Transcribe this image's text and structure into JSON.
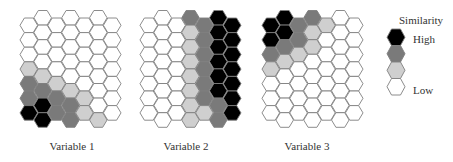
{
  "chart_data": {
    "type": "heatmap",
    "subtype": "hexagonal self-organizing map component planes",
    "title": "",
    "scale": {
      "legend_title": "Similarity",
      "high_label": "High",
      "low_label": "Low",
      "levels": [
        {
          "level": 3,
          "name": "high",
          "color": "#000000"
        },
        {
          "level": 2,
          "name": "mid-high",
          "color": "#7a7a7a"
        },
        {
          "level": 1,
          "name": "mid-low",
          "color": "#cfcfcf"
        },
        {
          "level": 0,
          "name": "low",
          "color": "#ffffff"
        }
      ]
    },
    "grid": {
      "columns": 7,
      "rows_even_column": 7,
      "rows_odd_column": 8,
      "orientation": "flat-top hexagons, odd columns shifted up by half a cell"
    },
    "maps": [
      {
        "label": "Variable 1",
        "columns": [
          [
            0,
            0,
            0,
            1,
            2,
            2,
            3
          ],
          [
            0,
            0,
            0,
            0,
            1,
            2,
            3,
            3
          ],
          [
            0,
            0,
            0,
            0,
            1,
            2,
            2
          ],
          [
            0,
            0,
            0,
            0,
            0,
            1,
            2,
            2
          ],
          [
            0,
            0,
            0,
            0,
            0,
            1,
            1
          ],
          [
            0,
            0,
            0,
            0,
            0,
            0,
            0,
            1
          ],
          [
            0,
            0,
            0,
            0,
            0,
            0,
            0
          ]
        ]
      },
      {
        "label": "Variable 2",
        "columns": [
          [
            0,
            0,
            0,
            0,
            0,
            0,
            0
          ],
          [
            0,
            0,
            0,
            0,
            0,
            0,
            0,
            0
          ],
          [
            0,
            0,
            0,
            0,
            0,
            0,
            0
          ],
          [
            2,
            1,
            1,
            1,
            1,
            1,
            1,
            1
          ],
          [
            2,
            2,
            2,
            2,
            2,
            2,
            1
          ],
          [
            3,
            3,
            3,
            3,
            3,
            3,
            2,
            2
          ],
          [
            3,
            3,
            3,
            3,
            3,
            3,
            3
          ]
        ]
      },
      {
        "label": "Variable 3",
        "columns": [
          [
            3,
            3,
            2,
            1,
            0,
            0,
            0
          ],
          [
            3,
            3,
            2,
            1,
            0,
            0,
            0,
            0
          ],
          [
            2,
            2,
            1,
            0,
            0,
            0,
            0
          ],
          [
            2,
            1,
            1,
            0,
            0,
            0,
            0,
            0
          ],
          [
            1,
            0,
            0,
            0,
            0,
            0,
            0
          ],
          [
            0,
            0,
            0,
            0,
            0,
            0,
            0,
            0
          ],
          [
            0,
            0,
            0,
            0,
            0,
            0,
            0
          ]
        ]
      }
    ]
  },
  "layout": {
    "map_origins_x": [
      20,
      140,
      262
    ],
    "label_centers_x": [
      72,
      186,
      307
    ]
  },
  "legend": {
    "title": "Similarity",
    "high": "High",
    "low": "Low"
  },
  "labels": {
    "map1": "Variable 1",
    "map2": "Variable 2",
    "map3": "Variable 3"
  }
}
